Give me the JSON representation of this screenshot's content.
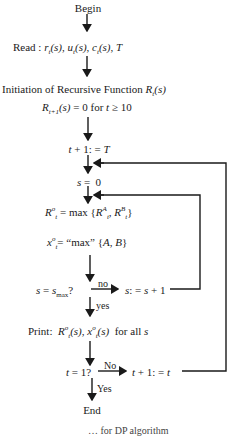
{
  "flowchart": {
    "nodes": {
      "begin": "Begin",
      "read_label": "Read :",
      "read_vars": "r_t(s), u_t(s), c_t(s), T",
      "init_title": "Initiation of Recursive Function",
      "init_fn": "R_t(s)",
      "init_cond": "R_{t+1}(s) = 0 for t ≥ 10",
      "assign_t": "t + 1: = T",
      "assign_s": "s = 0",
      "r_opt": "R_t^o = max {R_t^A, R_t^B}",
      "x_opt": "x_t^o = \"max\" {A, B}",
      "decision_s": "s = s_max?",
      "inc_s": "s: = s + 1",
      "print_label": "Print:",
      "print_vars": "R_t^o(s), x_t^o(s)  for all s",
      "decision_t": "t = 1?",
      "dec_t": "t + 1: = t",
      "end": "End"
    },
    "edge_labels": {
      "s_no": "no",
      "s_yes": "yes",
      "t_no": "No",
      "t_yes": "Yes"
    },
    "caption_partial": "… for DP algorithm"
  },
  "colors": {
    "line": "#1a1a1a",
    "background": "#ffffff"
  }
}
